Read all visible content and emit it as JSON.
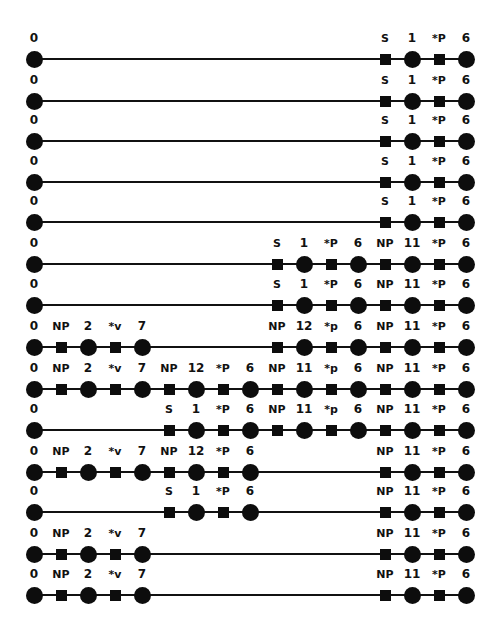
{
  "diagram": {
    "grid": {
      "x0": 34,
      "dx": 27,
      "slots": 17
    },
    "node_colors": {
      "fill": "#0d0d0d",
      "line": "#111111",
      "background": "#ffffff"
    },
    "rows": [
      {
        "y": 59,
        "segments": [
          [
            0,
            0
          ],
          [
            13,
            16
          ]
        ],
        "nodes": [
          {
            "slot": 0,
            "shape": "circle",
            "label": "0"
          },
          {
            "slot": 13,
            "shape": "square",
            "label": "S"
          },
          {
            "slot": 14,
            "shape": "circle",
            "label": "1"
          },
          {
            "slot": 15,
            "shape": "square",
            "label": "*P"
          },
          {
            "slot": 16,
            "shape": "circle",
            "label": "6"
          }
        ]
      },
      {
        "y": 101,
        "segments": [
          [
            0,
            0
          ],
          [
            13,
            16
          ]
        ],
        "nodes": [
          {
            "slot": 0,
            "shape": "circle",
            "label": "0"
          },
          {
            "slot": 13,
            "shape": "square",
            "label": "S"
          },
          {
            "slot": 14,
            "shape": "circle",
            "label": "1"
          },
          {
            "slot": 15,
            "shape": "square",
            "label": "*P"
          },
          {
            "slot": 16,
            "shape": "circle",
            "label": "6"
          }
        ]
      },
      {
        "y": 141,
        "segments": [
          [
            0,
            0
          ],
          [
            13,
            16
          ]
        ],
        "nodes": [
          {
            "slot": 0,
            "shape": "circle",
            "label": "0"
          },
          {
            "slot": 13,
            "shape": "square",
            "label": "S"
          },
          {
            "slot": 14,
            "shape": "circle",
            "label": "1"
          },
          {
            "slot": 15,
            "shape": "square",
            "label": "*P"
          },
          {
            "slot": 16,
            "shape": "circle",
            "label": "6"
          }
        ]
      },
      {
        "y": 182,
        "segments": [
          [
            0,
            0
          ],
          [
            13,
            16
          ]
        ],
        "nodes": [
          {
            "slot": 0,
            "shape": "circle",
            "label": "0"
          },
          {
            "slot": 13,
            "shape": "square",
            "label": "S"
          },
          {
            "slot": 14,
            "shape": "circle",
            "label": "1"
          },
          {
            "slot": 15,
            "shape": "square",
            "label": "*P"
          },
          {
            "slot": 16,
            "shape": "circle",
            "label": "6"
          }
        ]
      },
      {
        "y": 222,
        "segments": [
          [
            0,
            0
          ],
          [
            13,
            16
          ]
        ],
        "nodes": [
          {
            "slot": 0,
            "shape": "circle",
            "label": "0"
          },
          {
            "slot": 13,
            "shape": "square",
            "label": "S"
          },
          {
            "slot": 14,
            "shape": "circle",
            "label": "1"
          },
          {
            "slot": 15,
            "shape": "square",
            "label": "*P"
          },
          {
            "slot": 16,
            "shape": "circle",
            "label": "6"
          }
        ]
      },
      {
        "y": 264,
        "segments": [],
        "nodes": [
          {
            "slot": 0,
            "shape": "circle",
            "label": "0"
          },
          {
            "slot": 9,
            "shape": "square",
            "label": "S"
          },
          {
            "slot": 10,
            "shape": "circle",
            "label": "1"
          },
          {
            "slot": 11,
            "shape": "square",
            "label": "*P"
          },
          {
            "slot": 12,
            "shape": "circle",
            "label": "6"
          },
          {
            "slot": 13,
            "shape": "square",
            "label": "NP"
          },
          {
            "slot": 14,
            "shape": "circle",
            "label": "11"
          },
          {
            "slot": 15,
            "shape": "square",
            "label": "*P"
          },
          {
            "slot": 16,
            "shape": "circle",
            "label": "6"
          }
        ]
      },
      {
        "y": 305,
        "segments": [],
        "nodes": [
          {
            "slot": 0,
            "shape": "circle",
            "label": "0"
          },
          {
            "slot": 9,
            "shape": "square",
            "label": "S"
          },
          {
            "slot": 10,
            "shape": "circle",
            "label": "1"
          },
          {
            "slot": 11,
            "shape": "square",
            "label": "*P"
          },
          {
            "slot": 12,
            "shape": "circle",
            "label": "6"
          },
          {
            "slot": 13,
            "shape": "square",
            "label": "NP"
          },
          {
            "slot": 14,
            "shape": "circle",
            "label": "11"
          },
          {
            "slot": 15,
            "shape": "square",
            "label": "*P"
          },
          {
            "slot": 16,
            "shape": "circle",
            "label": "6"
          }
        ]
      },
      {
        "y": 347,
        "segments": [],
        "nodes": [
          {
            "slot": 0,
            "shape": "circle",
            "label": "0"
          },
          {
            "slot": 1,
            "shape": "square",
            "label": "NP"
          },
          {
            "slot": 2,
            "shape": "circle",
            "label": "2"
          },
          {
            "slot": 3,
            "shape": "square",
            "label": "*v"
          },
          {
            "slot": 4,
            "shape": "circle",
            "label": "7"
          },
          {
            "slot": 9,
            "shape": "square",
            "label": "NP"
          },
          {
            "slot": 10,
            "shape": "circle",
            "label": "12"
          },
          {
            "slot": 11,
            "shape": "square",
            "label": "*p"
          },
          {
            "slot": 12,
            "shape": "circle",
            "label": "6"
          },
          {
            "slot": 13,
            "shape": "square",
            "label": "NP"
          },
          {
            "slot": 14,
            "shape": "circle",
            "label": "11"
          },
          {
            "slot": 15,
            "shape": "square",
            "label": "*P"
          },
          {
            "slot": 16,
            "shape": "circle",
            "label": "6"
          }
        ]
      },
      {
        "y": 389,
        "segments": [],
        "nodes": [
          {
            "slot": 0,
            "shape": "circle",
            "label": "0"
          },
          {
            "slot": 1,
            "shape": "square",
            "label": "NP"
          },
          {
            "slot": 2,
            "shape": "circle",
            "label": "2"
          },
          {
            "slot": 3,
            "shape": "square",
            "label": "*v"
          },
          {
            "slot": 4,
            "shape": "circle",
            "label": "7"
          },
          {
            "slot": 5,
            "shape": "square",
            "label": "NP"
          },
          {
            "slot": 6,
            "shape": "circle",
            "label": "12"
          },
          {
            "slot": 7,
            "shape": "square",
            "label": "*P"
          },
          {
            "slot": 8,
            "shape": "circle",
            "label": "6"
          },
          {
            "slot": 9,
            "shape": "square",
            "label": "NP"
          },
          {
            "slot": 10,
            "shape": "circle",
            "label": "11"
          },
          {
            "slot": 11,
            "shape": "square",
            "label": "*p"
          },
          {
            "slot": 12,
            "shape": "circle",
            "label": "6"
          },
          {
            "slot": 13,
            "shape": "square",
            "label": "NP"
          },
          {
            "slot": 14,
            "shape": "circle",
            "label": "11"
          },
          {
            "slot": 15,
            "shape": "square",
            "label": "*P"
          },
          {
            "slot": 16,
            "shape": "circle",
            "label": "6"
          }
        ]
      },
      {
        "y": 430,
        "segments": [],
        "nodes": [
          {
            "slot": 0,
            "shape": "circle",
            "label": "0"
          },
          {
            "slot": 5,
            "shape": "square",
            "label": "S"
          },
          {
            "slot": 6,
            "shape": "circle",
            "label": "1"
          },
          {
            "slot": 7,
            "shape": "square",
            "label": "*P"
          },
          {
            "slot": 8,
            "shape": "circle",
            "label": "6"
          },
          {
            "slot": 9,
            "shape": "square",
            "label": "NP"
          },
          {
            "slot": 10,
            "shape": "circle",
            "label": "11"
          },
          {
            "slot": 11,
            "shape": "square",
            "label": "*p"
          },
          {
            "slot": 12,
            "shape": "circle",
            "label": "6"
          },
          {
            "slot": 13,
            "shape": "square",
            "label": "NP"
          },
          {
            "slot": 14,
            "shape": "circle",
            "label": "11"
          },
          {
            "slot": 15,
            "shape": "square",
            "label": "*P"
          },
          {
            "slot": 16,
            "shape": "circle",
            "label": "6"
          }
        ]
      },
      {
        "y": 472,
        "segments": [],
        "nodes": [
          {
            "slot": 0,
            "shape": "circle",
            "label": "0"
          },
          {
            "slot": 1,
            "shape": "square",
            "label": "NP"
          },
          {
            "slot": 2,
            "shape": "circle",
            "label": "2"
          },
          {
            "slot": 3,
            "shape": "square",
            "label": "*v"
          },
          {
            "slot": 4,
            "shape": "circle",
            "label": "7"
          },
          {
            "slot": 5,
            "shape": "square",
            "label": "NP"
          },
          {
            "slot": 6,
            "shape": "circle",
            "label": "12"
          },
          {
            "slot": 7,
            "shape": "square",
            "label": "*P"
          },
          {
            "slot": 8,
            "shape": "circle",
            "label": "6"
          },
          {
            "slot": 13,
            "shape": "square",
            "label": "NP"
          },
          {
            "slot": 14,
            "shape": "circle",
            "label": "11"
          },
          {
            "slot": 15,
            "shape": "square",
            "label": "*P"
          },
          {
            "slot": 16,
            "shape": "circle",
            "label": "6"
          }
        ]
      },
      {
        "y": 512,
        "segments": [],
        "nodes": [
          {
            "slot": 0,
            "shape": "circle",
            "label": "0"
          },
          {
            "slot": 5,
            "shape": "square",
            "label": "S"
          },
          {
            "slot": 6,
            "shape": "circle",
            "label": "1"
          },
          {
            "slot": 7,
            "shape": "square",
            "label": "*P"
          },
          {
            "slot": 8,
            "shape": "circle",
            "label": "6"
          },
          {
            "slot": 13,
            "shape": "square",
            "label": "NP"
          },
          {
            "slot": 14,
            "shape": "circle",
            "label": "11"
          },
          {
            "slot": 15,
            "shape": "square",
            "label": "*P"
          },
          {
            "slot": 16,
            "shape": "circle",
            "label": "6"
          }
        ]
      },
      {
        "y": 554,
        "segments": [],
        "nodes": [
          {
            "slot": 0,
            "shape": "circle",
            "label": "0"
          },
          {
            "slot": 1,
            "shape": "square",
            "label": "NP"
          },
          {
            "slot": 2,
            "shape": "circle",
            "label": "2"
          },
          {
            "slot": 3,
            "shape": "square",
            "label": "*v"
          },
          {
            "slot": 4,
            "shape": "circle",
            "label": "7"
          },
          {
            "slot": 13,
            "shape": "square",
            "label": "NP"
          },
          {
            "slot": 14,
            "shape": "circle",
            "label": "11"
          },
          {
            "slot": 15,
            "shape": "square",
            "label": "*P"
          },
          {
            "slot": 16,
            "shape": "circle",
            "label": "6"
          }
        ]
      },
      {
        "y": 595,
        "segments": [],
        "nodes": [
          {
            "slot": 0,
            "shape": "circle",
            "label": "0"
          },
          {
            "slot": 1,
            "shape": "square",
            "label": "NP"
          },
          {
            "slot": 2,
            "shape": "circle",
            "label": "2"
          },
          {
            "slot": 3,
            "shape": "square",
            "label": "*v"
          },
          {
            "slot": 4,
            "shape": "circle",
            "label": "7"
          },
          {
            "slot": 13,
            "shape": "square",
            "label": "NP"
          },
          {
            "slot": 14,
            "shape": "circle",
            "label": "11"
          },
          {
            "slot": 15,
            "shape": "square",
            "label": "*P"
          },
          {
            "slot": 16,
            "shape": "circle",
            "label": "6"
          }
        ]
      }
    ]
  }
}
